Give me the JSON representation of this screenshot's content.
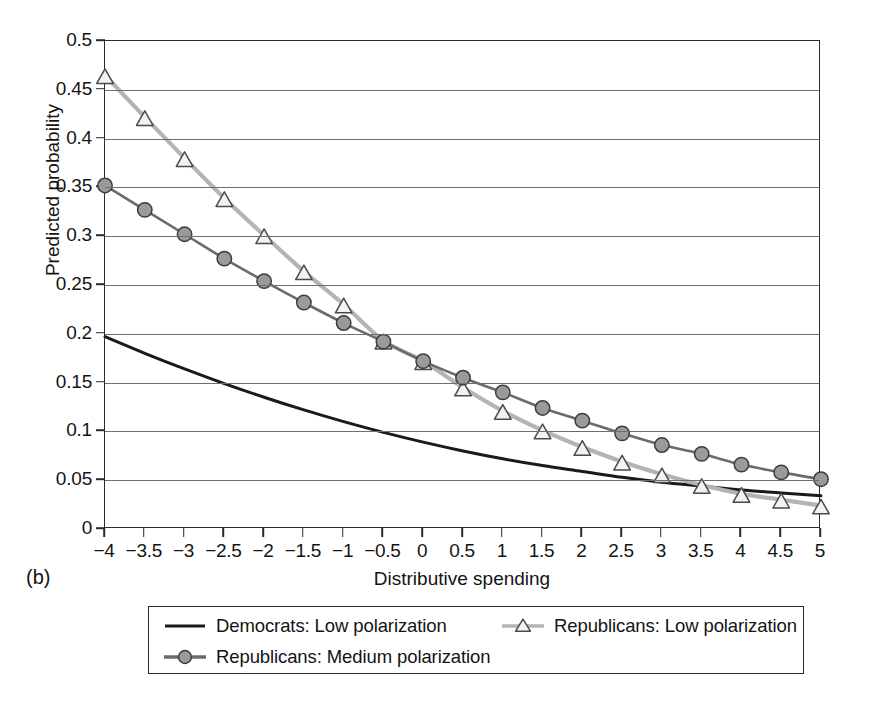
{
  "figure": {
    "panel_label": "(b)"
  },
  "axes": {
    "x_title": "Distributive spending",
    "y_title": "Predicted probability",
    "y_ticks": [
      "0",
      "0.05",
      "0.1",
      "0.15",
      "0.2",
      "0.25",
      "0.3",
      "0.35",
      "0.4",
      "0.45",
      "0.5"
    ],
    "x_ticks": [
      "-4",
      "-3.5",
      "-3",
      "-2.5",
      "-2",
      "-1.5",
      "-1",
      "-0.5",
      "0",
      "0.5",
      "1",
      "1.5",
      "2",
      "2.5",
      "3",
      "3.5",
      "4",
      "4.5",
      "5"
    ]
  },
  "legend": {
    "entries": [
      {
        "label": "Democrats: Low polarization",
        "marker": "none",
        "color": "#1a1a1a"
      },
      {
        "label": "Republicans: Low polarization",
        "marker": "triangle",
        "color": "#b4b4b4"
      },
      {
        "label": "Republicans: Medium polarization",
        "marker": "circle",
        "color": "#6b6b6b"
      }
    ]
  },
  "colors": {
    "democrats_low": "#1a1a1a",
    "republicans_low": "#b4b4b4",
    "republicans_medium": "#6b6b6b",
    "grid": "#6e6e6e",
    "frame": "#2b2b2b",
    "marker_fill_circle": "#9a9a9a",
    "marker_fill_triangle": "#f2f2f2",
    "background": "#ffffff"
  },
  "chart_data": {
    "type": "line",
    "title": "",
    "xlabel": "Distributive spending",
    "ylabel": "Predicted probability",
    "xlim": [
      -4,
      5
    ],
    "ylim": [
      0,
      0.5
    ],
    "grid": true,
    "legend_position": "below",
    "x": [
      -4,
      -3.5,
      -3,
      -2.5,
      -2,
      -1.5,
      -1,
      -0.5,
      0,
      0.5,
      1,
      1.5,
      2,
      2.5,
      3,
      3.5,
      4,
      4.5,
      5
    ],
    "series": [
      {
        "name": "Democrats: Low polarization",
        "marker": "none",
        "color": "#1a1a1a",
        "values": [
          0.197,
          0.18,
          0.164,
          0.149,
          0.135,
          0.122,
          0.11,
          0.099,
          0.089,
          0.08,
          0.072,
          0.065,
          0.059,
          0.053,
          0.048,
          0.044,
          0.04,
          0.037,
          0.034
        ]
      },
      {
        "name": "Republicans: Low polarization",
        "marker": "triangle",
        "color": "#b4b4b4",
        "values": [
          0.465,
          0.422,
          0.38,
          0.339,
          0.301,
          0.264,
          0.23,
          0.193,
          0.172,
          0.145,
          0.121,
          0.101,
          0.084,
          0.069,
          0.056,
          0.045,
          0.036,
          0.03,
          0.024
        ]
      },
      {
        "name": "Republicans: Medium polarization",
        "marker": "circle",
        "color": "#6b6b6b",
        "values": [
          0.352,
          0.327,
          0.302,
          0.277,
          0.254,
          0.232,
          0.211,
          0.192,
          0.172,
          0.155,
          0.14,
          0.124,
          0.111,
          0.098,
          0.086,
          0.077,
          0.066,
          0.058,
          0.051
        ]
      }
    ]
  }
}
